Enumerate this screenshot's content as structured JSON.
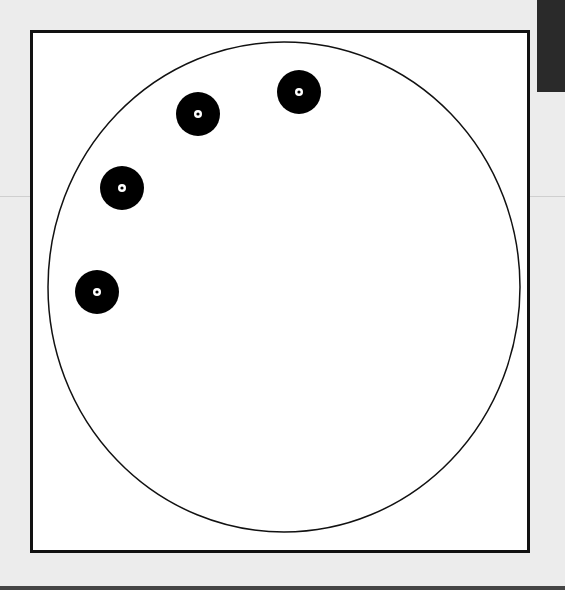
{
  "diagram": {
    "type": "circle-with-discs",
    "frame": {
      "x": 30,
      "y": 30,
      "width": 500,
      "height": 523,
      "stroke": "#111111",
      "fill": "#ffffff"
    },
    "outer_circle": {
      "cx": 284,
      "cy": 287,
      "rx": 236,
      "ry": 245,
      "stroke": "#111111",
      "stroke_width": 1.5
    },
    "discs": [
      {
        "id": "disc-1",
        "cx": 299,
        "cy": 92,
        "r": 22
      },
      {
        "id": "disc-2",
        "cx": 198,
        "cy": 114,
        "r": 22
      },
      {
        "id": "disc-3",
        "cx": 122,
        "cy": 188,
        "r": 22
      },
      {
        "id": "disc-4",
        "cx": 97,
        "cy": 292,
        "r": 22
      }
    ],
    "disc_style": {
      "fill": "#000000",
      "center_ring_fill": "#ffffff",
      "center_ring_r": 4,
      "center_dot_r": 1.6
    },
    "colors": {
      "background": "#ececec",
      "panel": "#ffffff",
      "ink": "#111111",
      "corner_tab": "#2a2a2a"
    }
  }
}
